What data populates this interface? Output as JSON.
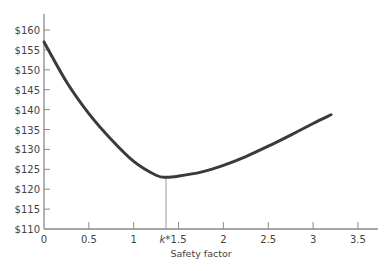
{
  "chart_data": {
    "type": "line",
    "title": "",
    "xlabel": "Safety factor",
    "ylabel": "",
    "xlim": [
      0,
      3.7
    ],
    "ylim": [
      110,
      163
    ],
    "x_ticks": [
      "0",
      "0.5",
      "1",
      "1.5",
      "2",
      "2.5",
      "3",
      "3.5"
    ],
    "x_tick_values": [
      0,
      0.5,
      1,
      1.5,
      2,
      2.5,
      3,
      3.5
    ],
    "y_ticks": [
      "$110",
      "$115",
      "$120",
      "$125",
      "$130",
      "$135",
      "$140",
      "$145",
      "$150",
      "$155",
      "$160"
    ],
    "y_tick_values": [
      110,
      115,
      120,
      125,
      130,
      135,
      140,
      145,
      150,
      155,
      160
    ],
    "grid": false,
    "legend": null,
    "annotations": [
      {
        "type": "vertical-line",
        "x": 1.36,
        "label": "k*",
        "label_style": "italic"
      }
    ],
    "series": [
      {
        "name": "Total cost",
        "x": [
          0,
          0.25,
          0.5,
          0.75,
          1.0,
          1.25,
          1.36,
          1.5,
          1.75,
          2.0,
          2.25,
          2.5,
          2.75,
          3.0,
          3.2
        ],
        "y": [
          157,
          147,
          139,
          132.5,
          127,
          123.5,
          123,
          123.3,
          124.3,
          126,
          128.2,
          130.8,
          133.6,
          136.5,
          138.7
        ]
      }
    ],
    "colors": {
      "curve": "#3a3a3a",
      "axis": "#8a8a8a",
      "marker_line": "#9a9a9a"
    }
  },
  "labels": {
    "k_star": "k*"
  }
}
